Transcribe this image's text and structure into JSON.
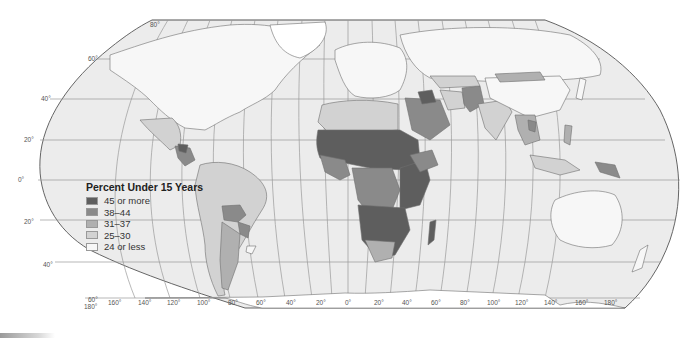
{
  "map": {
    "projection": "Robinson",
    "legend": {
      "title": "Percent Under 15 Years",
      "items": [
        {
          "label": "45 or more",
          "color": "#5e5e5e"
        },
        {
          "label": "38–44",
          "color": "#8a8a8a"
        },
        {
          "label": "31–37",
          "color": "#b0b0b0"
        },
        {
          "label": "25–30",
          "color": "#d2d2d2"
        },
        {
          "label": "24 or less",
          "color": "#f7f7f7"
        }
      ]
    },
    "latitude_labels": [
      "80°",
      "60°",
      "40°",
      "20°",
      "0°",
      "20°",
      "40°",
      "60°"
    ],
    "longitude_labels": [
      "180°",
      "160°",
      "140°",
      "120°",
      "100°",
      "80°",
      "60°",
      "40°",
      "20°",
      "0°",
      "20°",
      "40°",
      "60°",
      "80°",
      "100°",
      "120°",
      "140°",
      "160°",
      "180°"
    ],
    "ocean_color": "#ececec",
    "graticule_color": "#9a9a9a"
  }
}
